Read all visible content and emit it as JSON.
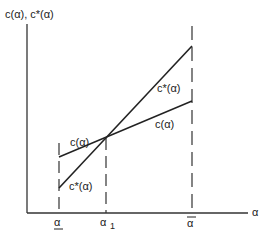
{
  "diagram": {
    "y_axis_label": "c(α), c*(α)",
    "x_axis_label": "α",
    "x_ticks": [
      {
        "id": "alpha-lower",
        "label": "α",
        "decoration": "underline"
      },
      {
        "id": "alpha-1",
        "label": "α",
        "subscript": "1"
      },
      {
        "id": "alpha-upper",
        "label": "α",
        "decoration": "overline"
      }
    ],
    "curves": [
      {
        "id": "c",
        "label": "c(α)",
        "description": "flatter line, higher at lower bound"
      },
      {
        "id": "c-star",
        "label": "c*(α)",
        "description": "steeper line, lower at lower bound"
      }
    ]
  }
}
